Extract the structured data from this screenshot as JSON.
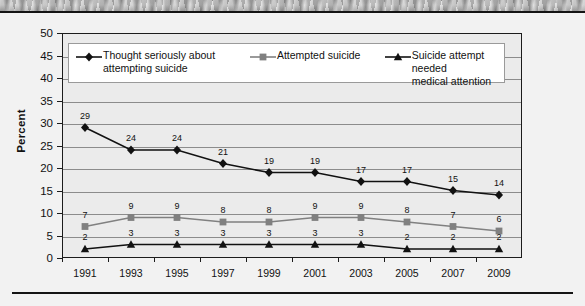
{
  "banner": {
    "alt": "grayscale-photo-strip"
  },
  "chart_data": {
    "type": "line",
    "title": "",
    "xlabel": "",
    "ylabel": "Percent",
    "ylim": [
      0,
      50
    ],
    "yticks": [
      0,
      5,
      10,
      15,
      20,
      25,
      30,
      35,
      40,
      45,
      50
    ],
    "grid": true,
    "legend_position": "inside-top",
    "categories": [
      "1991",
      "1993",
      "1995",
      "1997",
      "1999",
      "2001",
      "2003",
      "2005",
      "2007",
      "2009"
    ],
    "x": [
      1991,
      1993,
      1995,
      1997,
      1999,
      2001,
      2003,
      2005,
      2007,
      2009
    ],
    "series": [
      {
        "name": "Thought seriously about attempting suicide",
        "legend_lines": [
          "Thought seriously about",
          "attempting suicide"
        ],
        "marker": "diamond",
        "color": "#111111",
        "values": [
          29,
          24,
          24,
          21,
          19,
          19,
          17,
          17,
          15,
          14
        ]
      },
      {
        "name": "Attempted suicide",
        "legend_lines": [
          "Attempted suicide"
        ],
        "marker": "square",
        "color": "#808080",
        "values": [
          7,
          9,
          9,
          8,
          8,
          9,
          9,
          8,
          7,
          6
        ]
      },
      {
        "name": "Suicide attempt needed medical attention",
        "legend_lines": [
          "Suicide attempt needed",
          "medical attention"
        ],
        "marker": "triangle",
        "color": "#111111",
        "values": [
          2,
          3,
          3,
          3,
          3,
          3,
          3,
          2,
          2,
          2
        ]
      }
    ]
  },
  "colors": {
    "plot_background": "#ebebeb",
    "page_background": "#f2f2f2",
    "gridline": "#8c8c8c",
    "axis": "#1c1c1c",
    "series_dark": "#111111",
    "series_gray": "#808080"
  }
}
